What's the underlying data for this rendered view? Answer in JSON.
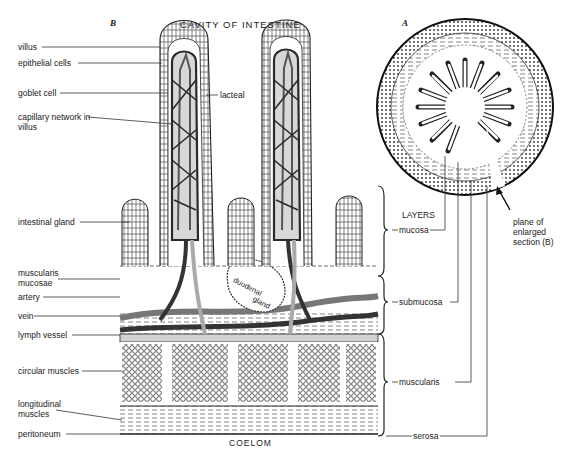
{
  "figure": {
    "panel_b_label": "B",
    "panel_a_label": "A",
    "top_caption": "CAVITY OF INTESTINE",
    "bottom_caption": "COELOM"
  },
  "left_labels": [
    {
      "text": "villus"
    },
    {
      "text": "epithelial cells"
    },
    {
      "text": "goblet cell"
    },
    {
      "text": "capillary network in villus"
    },
    {
      "text": "intestinal gland"
    },
    {
      "text": "muscularis mucosae"
    },
    {
      "text": "artery"
    },
    {
      "text": "vein"
    },
    {
      "text": "lymph vessel"
    },
    {
      "text": "circular muscles"
    },
    {
      "text": "longitudinal muscles"
    },
    {
      "text": "peritoneum"
    }
  ],
  "inner_labels": {
    "lacteal": "lacteal",
    "duodenal": "duodenal",
    "gland": "gland"
  },
  "layers": {
    "heading": "LAYERS",
    "items": [
      {
        "text": "mucosa"
      },
      {
        "text": "submucosa"
      },
      {
        "text": "muscularis"
      },
      {
        "text": "serosa"
      }
    ]
  },
  "plane_note": "plane of enlarged section (B)",
  "colors": {
    "ink": "#1a1a1a",
    "vessel_dark": "#3a3a3a",
    "vessel_mid": "#8a8a8a",
    "lymph": "#cfcfcf",
    "paper": "#ffffff"
  }
}
